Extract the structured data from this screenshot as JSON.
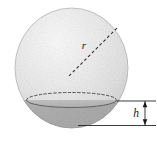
{
  "figure": {
    "name": "spherical-cap-diagram",
    "background_color": "#ffffff"
  },
  "sphere": {
    "label": "sphere",
    "center_x": 71.5,
    "center_y": 68,
    "radius_x": 56.5,
    "radius_y": 60,
    "fill_light": "#f2f2f2",
    "fill_mid": "#dcdcdc",
    "fill_dark": "#c8c8c8",
    "outline_color": "#b4b4b4"
  },
  "radius": {
    "label": "r",
    "label_x": 84,
    "label_y": 49,
    "line_from_x": 69,
    "line_from_y": 76,
    "line_to_x": 117,
    "line_to_y": 28,
    "dash_pattern": "3,2.4",
    "color": "#2b2b2b"
  },
  "cap": {
    "label": "spherical-cap",
    "plane_y": 100,
    "ellipse_center_x": 71.5,
    "ellipse_radius_x": 45,
    "ellipse_radius_y": 7.5,
    "fill_color": "#b9b9b9",
    "rim_dashed_color": "#4a4a4a",
    "rim_solid_color": "#606060",
    "rim_dash_pattern": "2.6,2.2"
  },
  "dimension": {
    "label": "h",
    "label_x": 134,
    "label_y": 117,
    "arrow_x": 145,
    "top_y": 101,
    "bottom_y": 125,
    "upper_leader_from_x": 117,
    "upper_leader_to_x": 156,
    "lower_leader_from_x": 78,
    "lower_leader_to_x": 156,
    "color": "#1a1a1a"
  }
}
